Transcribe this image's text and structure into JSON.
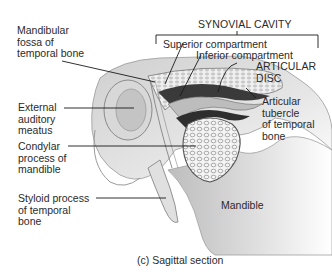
{
  "figure": {
    "caption": "(c) Sagittal section",
    "group_label": "SYNOVIAL CAVITY",
    "labels": {
      "mandibular_fossa": "Mandibular\nfossa of\ntemporal bone",
      "external_auditory_meatus": "External\nauditory\nmeatus",
      "condylar_process": "Condylar\nprocess of\nmandible",
      "styloid_process": "Styloid process\nof temporal\nbone",
      "superior_compartment": "Superior compartment",
      "inferior_compartment": "Inferior compartment",
      "articular_disc": "ARTICULAR\nDISC",
      "articular_tubercle": "Articular\ntubercle\nof temporal\nbone",
      "mandible": "Mandible"
    }
  }
}
